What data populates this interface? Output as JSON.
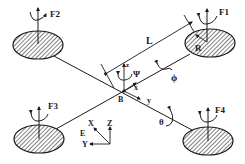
{
  "diagram": {
    "colors": {
      "stroke": "#1a1a1a",
      "background": "#ffffff"
    },
    "rotors": [
      {
        "id": "F1",
        "label": "F1"
      },
      {
        "id": "F2",
        "label": "F2"
      },
      {
        "id": "F3",
        "label": "F3"
      },
      {
        "id": "F4",
        "label": "F4"
      }
    ],
    "body_center": "B",
    "arm_length_label": "L",
    "rotor_radius_label": "R",
    "body_frame": {
      "x": "x",
      "y": "y",
      "z": "z",
      "yaw": "Ψ"
    },
    "rotations": {
      "roll": "ϕ",
      "pitch": "θ"
    },
    "earth_frame": {
      "origin": "E",
      "X": "X",
      "Y": "Y",
      "Z": "Z"
    }
  }
}
